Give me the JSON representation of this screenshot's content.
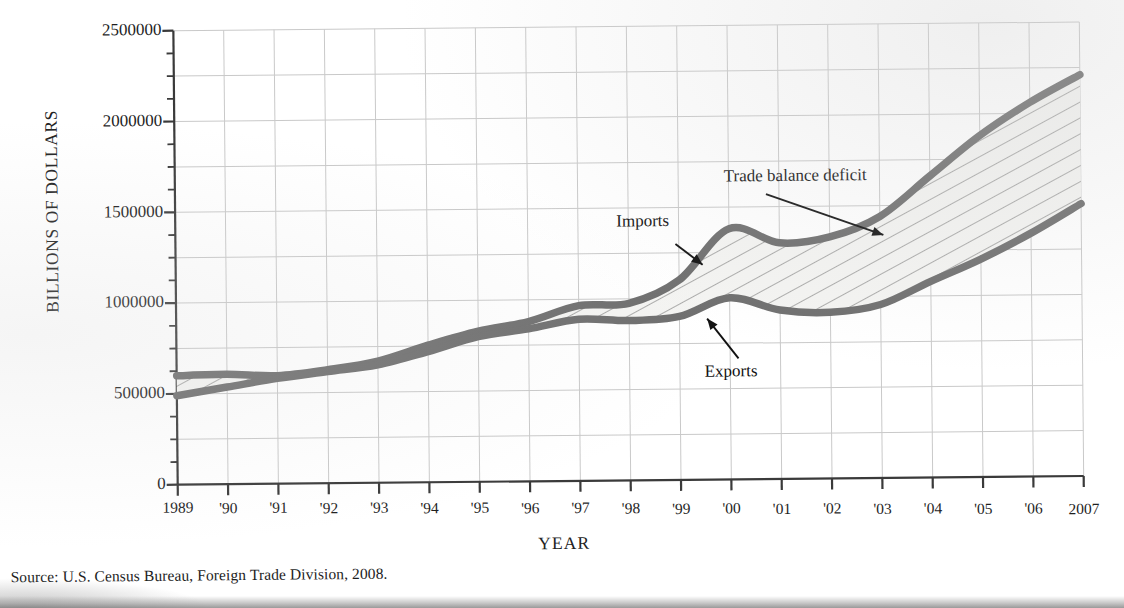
{
  "figure": {
    "source_note": "Source: U.S. Census Bureau, Foreign Trade Division, 2008.",
    "axis_color": "#3a3a3a",
    "grid_color": "#c9c9c9",
    "curve_color": "#6e6e6e",
    "hatch_color": "#8a8a8a",
    "fill_color": "#f4f4f2"
  },
  "chart_data": {
    "type": "area",
    "title": "",
    "subtitle": "",
    "xlabel": "YEAR",
    "ylabel": "BILLIONS OF DOLLARS",
    "xlim": [
      1989,
      2007
    ],
    "ylim": [
      0,
      2500000
    ],
    "grid": true,
    "grid_y_step": 250000,
    "grid_x_step": 1,
    "legend_position": "inline-annotations",
    "y_ticks": [
      0,
      500000,
      1000000,
      1500000,
      2000000,
      2500000
    ],
    "y_tick_labels": [
      "0",
      "500000",
      "1000000",
      "1500000",
      "2000000",
      "2500000"
    ],
    "y_minor_tick_step": 125000,
    "x": [
      1989,
      1990,
      1991,
      1992,
      1993,
      1994,
      1995,
      1996,
      1997,
      1998,
      1999,
      2000,
      2001,
      2002,
      2003,
      2004,
      2005,
      2006,
      2007
    ],
    "x_tick_labels": [
      "1989",
      "'90",
      "'91",
      "'92",
      "'93",
      "'94",
      "'95",
      "'96",
      "'97",
      "'98",
      "'99",
      "'00",
      "'01",
      "'02",
      "'03",
      "'04",
      "'05",
      "'06",
      "2007"
    ],
    "series": [
      {
        "name": "Imports",
        "values": [
          600000,
          605000,
          595000,
          625000,
          670000,
          755000,
          830000,
          880000,
          965000,
          975000,
          1100000,
          1380000,
          1300000,
          1330000,
          1440000,
          1660000,
          1880000,
          2060000,
          2210000
        ]
      },
      {
        "name": "Exports",
        "values": [
          490000,
          535000,
          580000,
          615000,
          650000,
          720000,
          800000,
          840000,
          890000,
          880000,
          900000,
          1000000,
          930000,
          915000,
          955000,
          1080000,
          1200000,
          1340000,
          1500000
        ]
      }
    ],
    "annotations": [
      {
        "label": "Imports",
        "target_series": "Imports",
        "target_year": 1999
      },
      {
        "label": "Exports",
        "target_series": "Exports",
        "target_year": 1998
      },
      {
        "label": "Trade balance deficit",
        "target_series": "band",
        "target_year": 2003
      }
    ]
  }
}
